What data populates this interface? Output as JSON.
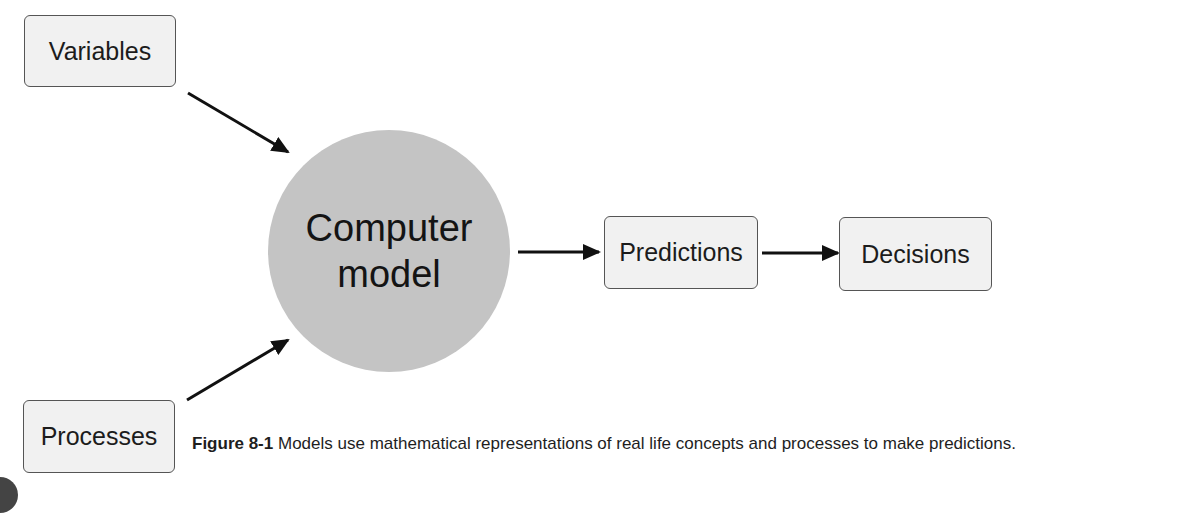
{
  "diagram": {
    "nodes": {
      "variables": {
        "label": "Variables"
      },
      "processes": {
        "label": "Processes"
      },
      "model": {
        "line1": "Computer",
        "line2": "model"
      },
      "predictions": {
        "label": "Predictions"
      },
      "decisions": {
        "label": "Decisions"
      }
    },
    "edges": [
      {
        "from": "Variables",
        "to": "Computer model"
      },
      {
        "from": "Processes",
        "to": "Computer model"
      },
      {
        "from": "Computer model",
        "to": "Predictions"
      },
      {
        "from": "Predictions",
        "to": "Decisions"
      }
    ],
    "colors": {
      "circle_fill": "#c4c4c4",
      "box_fill": "#f1f1f1",
      "box_border": "#555555",
      "arrow": "#111111"
    }
  },
  "caption": {
    "label": "Figure 8-1",
    "text": " Models use mathematical representations of real life concepts and processes to make predictions."
  }
}
